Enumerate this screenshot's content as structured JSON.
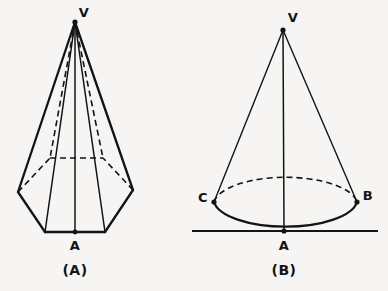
{
  "figure": {
    "background_color": "#f6f5f3",
    "ink_color": "#141414",
    "panels": [
      {
        "id": "panel-a",
        "caption": "(A)",
        "shape": "hexagonal-pyramid",
        "labels": [
          {
            "name": "apex",
            "text": "V",
            "x": 84,
            "y": 17
          },
          {
            "name": "base-center",
            "text": "A",
            "x": 75,
            "y": 250
          }
        ],
        "caption_position": {
          "x": 75,
          "y": 275
        }
      },
      {
        "id": "panel-b",
        "caption": "(B)",
        "shape": "cone",
        "labels": [
          {
            "name": "apex",
            "text": "V",
            "x": 293,
            "y": 22
          },
          {
            "name": "base-center",
            "text": "A",
            "x": 284,
            "y": 250
          },
          {
            "name": "base-right",
            "text": "B",
            "x": 368,
            "y": 200
          },
          {
            "name": "base-left",
            "text": "C",
            "x": 203,
            "y": 202
          }
        ],
        "caption_position": {
          "x": 284,
          "y": 275
        }
      }
    ],
    "geometry": {
      "pyramid": {
        "apex": {
          "x": 75,
          "y": 22
        },
        "base_center": {
          "x": 75,
          "y": 232
        },
        "base_front_left": {
          "x": 45,
          "y": 232
        },
        "base_front_right": {
          "x": 105,
          "y": 232
        },
        "base_left": {
          "x": 18,
          "y": 192
        },
        "base_right": {
          "x": 133,
          "y": 190
        },
        "base_back_left": {
          "x": 50,
          "y": 158
        },
        "base_back_right": {
          "x": 103,
          "y": 158
        }
      },
      "cone": {
        "apex": {
          "x": 283,
          "y": 30
        },
        "base_center": {
          "x": 284,
          "y": 231
        },
        "base_left_c": {
          "x": 214,
          "y": 202
        },
        "base_right_b": {
          "x": 357,
          "y": 202
        },
        "ellipse_center": {
          "x": 285,
          "y": 203
        },
        "ellipse_rx": 72,
        "ellipse_ry": 28,
        "ground_line": {
          "x1": 192,
          "x2": 378,
          "y": 231
        }
      }
    }
  }
}
